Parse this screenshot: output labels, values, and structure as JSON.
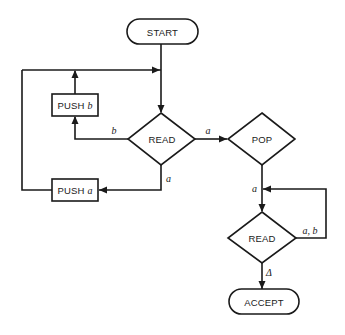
{
  "diagram": {
    "type": "flowchart",
    "colors": {
      "stroke": "#1a1a1a",
      "background": "#ffffff"
    },
    "nodes": {
      "start": {
        "label": "START",
        "shape": "terminal"
      },
      "read1": {
        "label": "READ",
        "shape": "decision"
      },
      "push_b": {
        "label": "PUSH",
        "var": "b",
        "shape": "process"
      },
      "push_a": {
        "label": "PUSH",
        "var": "a",
        "shape": "process"
      },
      "pop": {
        "label": "POP",
        "shape": "decision"
      },
      "read2": {
        "label": "READ",
        "shape": "decision"
      },
      "accept": {
        "label": "ACCEPT",
        "shape": "terminal"
      }
    },
    "edges": {
      "read1_to_push_b": {
        "label": "b"
      },
      "read1_to_pop": {
        "label": "a"
      },
      "read1_to_push_a": {
        "label": "a"
      },
      "pop_to_read2": {
        "label": "a"
      },
      "read2_loop": {
        "label": "a, b"
      },
      "read2_to_accept": {
        "label": "Δ"
      }
    }
  }
}
